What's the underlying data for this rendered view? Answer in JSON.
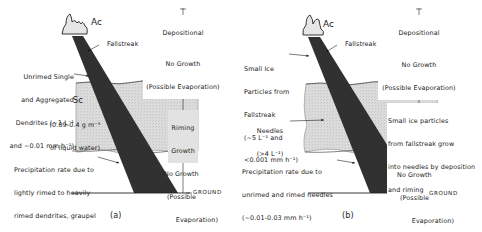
{
  "panels": [
    {
      "id": "a",
      "caption": "(a)",
      "cloud_top": "Ac",
      "fallstreak": "Fallstreak",
      "cloud_mid": {
        "name": "Sc",
        "lwc_line1": "(0.09-0.4 g m⁻³",
        "lwc_line2": "of liquid water)"
      },
      "left_labels": {
        "upper": [
          "Unrimed Single",
          "and Aggregated",
          "Dendrites (~1 L⁻¹",
          "and ~0.01 mm h⁻¹)"
        ],
        "lower": [
          "Precipitation rate due to",
          "lightly rimed to heavily",
          "rimed dendrites, graupel",
          "(~0.02 - 0.08 mm h⁻¹)"
        ]
      },
      "right_labels": {
        "depositional": [
          "Depositional",
          "Growth"
        ],
        "no_growth_top": [
          "No Growth",
          "(Possible Evaporation)"
        ],
        "riming": [
          "Riming",
          "Growth"
        ],
        "no_growth_bottom": [
          "No Growth",
          "(Possible",
          "Evaporation)"
        ]
      },
      "ground": "GROUND"
    },
    {
      "id": "b",
      "caption": "(b)",
      "cloud_top": "Ac",
      "fallstreak": "Fallstreak",
      "left_labels": {
        "upper": [
          "Small Ice",
          "Particles from",
          "Fallstreak",
          "(~5 L⁻¹ and",
          "<0.001 mm h⁻¹)"
        ],
        "middle": [
          "Needles",
          "(>4 L⁻¹)"
        ],
        "lower": [
          "Precipitation rate due to",
          "unrimed and rimed needles",
          "(~0.01-0.03 mm h⁻¹)"
        ]
      },
      "right_labels": {
        "depositional": [
          "Depositional",
          "Growth"
        ],
        "no_growth_top": [
          "No Growth",
          "(Possible Evaporation)"
        ],
        "in_cloud": [
          "Small ice particles",
          "from fallstreak grow",
          "into needles by deposition",
          "and riming"
        ],
        "no_growth_bottom": [
          "No Growth",
          "(Possible",
          "Evaporation)"
        ]
      },
      "ground": "GROUND"
    }
  ],
  "colors": {
    "ink": "#1a1a1a",
    "cloud_fill": "#d8d8d8",
    "streak_fill": "#2a2a2a",
    "background": "#ffffff"
  }
}
